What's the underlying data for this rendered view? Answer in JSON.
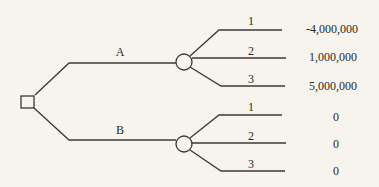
{
  "diagram": {
    "type": "decision-tree",
    "decision_node": {
      "shape": "square"
    },
    "options": [
      {
        "label": "A",
        "chance_node": {
          "shape": "circle"
        },
        "outcomes": [
          {
            "label": "1",
            "payoff": "-4,000,000"
          },
          {
            "label": "2",
            "payoff": "1,000,000"
          },
          {
            "label": "3",
            "payoff": "5,000,000"
          }
        ]
      },
      {
        "label": "B",
        "chance_node": {
          "shape": "circle"
        },
        "outcomes": [
          {
            "label": "1",
            "payoff": "0"
          },
          {
            "label": "2",
            "payoff": "0"
          },
          {
            "label": "3",
            "payoff": "0"
          }
        ]
      }
    ]
  },
  "colors": {
    "background": "#f6f4ec",
    "line": "#3a3a3a",
    "text": "#2a2a2a"
  }
}
